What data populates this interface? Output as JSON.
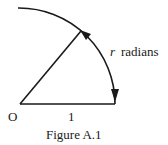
{
  "figure": {
    "caption": "Figure A.1",
    "origin_label": "O",
    "radius_label": "1",
    "arc_variable": "r",
    "arc_unit": "radians",
    "colors": {
      "stroke": "#1a1a1a",
      "background": "#ffffff"
    }
  }
}
